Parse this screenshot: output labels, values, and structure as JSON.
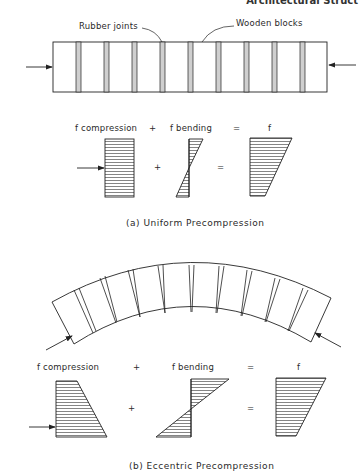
{
  "header": {
    "running_title": "Architectural Struct"
  },
  "part_a": {
    "labels": {
      "rubber_joints": "Rubber joints",
      "wooden_blocks": "Wooden blocks"
    },
    "equation": {
      "term1": "f compression",
      "op1": "+",
      "term2": "f bending",
      "op2": "=",
      "result": "f"
    },
    "caption": "(a) Uniform Precompression"
  },
  "part_b": {
    "equation": {
      "term1": "f compression",
      "op1": "+",
      "term2": "f bending",
      "op2": "=",
      "result": "f"
    },
    "caption": "(b) Eccentric Precompression"
  },
  "colors": {
    "line": "#222222",
    "joint_fill": "#bdbdbd",
    "background": "#ffffff"
  }
}
